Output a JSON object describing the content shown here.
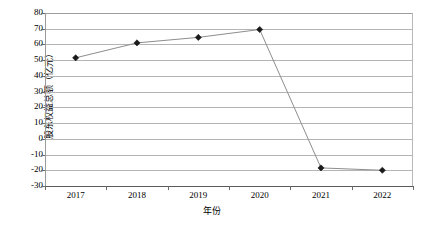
{
  "chart_data": {
    "type": "line",
    "title": "",
    "xlabel": "年份",
    "ylabel": "股东权益总额（亿元）",
    "categories": [
      "2017",
      "2018",
      "2019",
      "2020",
      "2021",
      "2022"
    ],
    "values": [
      51.5,
      61.0,
      64.5,
      69.5,
      -18.5,
      -20.0
    ],
    "series": [
      {
        "name": "股东权益总额",
        "values": [
          51.5,
          61.0,
          64.5,
          69.5,
          -18.5,
          -20.0
        ]
      }
    ],
    "ylim": [
      -30,
      80
    ],
    "ytick_step": 10,
    "yticks": [
      80,
      70,
      60,
      50,
      40,
      30,
      20,
      10,
      0,
      -10,
      -20,
      -30
    ],
    "ytick_labels": [
      "80",
      "70",
      "60",
      "50",
      "40",
      "30",
      "20",
      "10",
      "0",
      "-10",
      "-20",
      "-30"
    ],
    "grid": "horizontal",
    "legend": "none",
    "marker": "diamond",
    "line_color": "#8d8d8d",
    "marker_color": "#1a1a1a",
    "grid_color": "#b4b4b4",
    "background": "#ffffff"
  }
}
